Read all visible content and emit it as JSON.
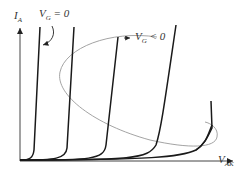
{
  "diagram": {
    "type": "thyristor I-V characteristics",
    "axes": {
      "y_label": "I",
      "y_label_sub": "A",
      "x_label": "V",
      "x_label_sub": "AK"
    },
    "annotations": [
      {
        "id": "vg-zero",
        "text_main": "V",
        "text_sub": "G",
        "text_rest": " = 0"
      },
      {
        "id": "vg-negative",
        "text_main": "V",
        "text_sub": "G",
        "text_rest": " < 0"
      }
    ],
    "curves": [
      {
        "name": "curve-1",
        "breakover_x": 35
      },
      {
        "name": "curve-2",
        "breakover_x": 70
      },
      {
        "name": "curve-3",
        "breakover_x": 110
      },
      {
        "name": "curve-4",
        "breakover_x": 165
      },
      {
        "name": "curve-5",
        "breakover_x": 215
      }
    ],
    "colors": {
      "curve": "#1a1a1a",
      "axis": "#333333",
      "ellipse": "#999999"
    }
  }
}
